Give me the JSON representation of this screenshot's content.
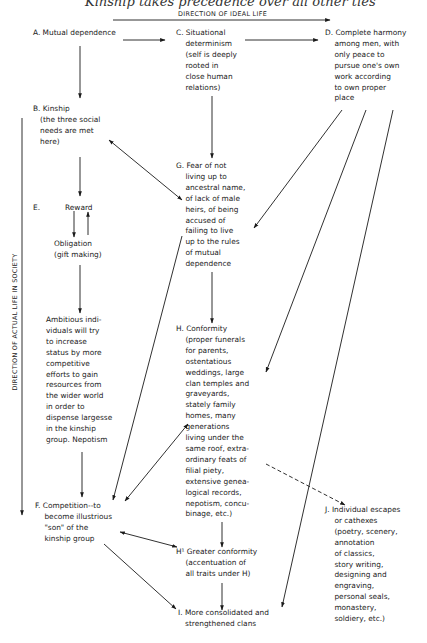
{
  "caption": "Kinship takes precedence over all other ties",
  "axes": {
    "horizontal": "DIRECTION OF IDEAL LIFE",
    "vertical": "DIRECTION OF ACTUAL LIFE IN SOCIETY"
  },
  "nodes": {
    "A": "A. Mutual dependence",
    "B": "B. Kinship\n   (the three social\n   needs are met\n   here)",
    "C": "C. Situational\n    determinism\n    (self is deeply\n    rooted in\n    close human\n    relations)",
    "D": "D. Complete harmony\n    among men, with\n    only peace to\n    pursue one's own\n    work according\n    to own proper\n    place",
    "E_label": "E.",
    "E_reward": "Reward",
    "E_obligation": "Obligation\n(gift making)",
    "E_ambition": "Ambitious indi-\nviduals will try\nto increase\nstatus by more\ncompetitive\nefforts to gain\nresources from\nthe wider world\nin order to\ndispense largesse\nin the kinship\ngroup. Nepotism",
    "F": "F. Competition--to\n    become illustrious\n    \"son\" of the\n    kinship group",
    "G": "G. Fear of not\n    living up to\n    ancestral name,\n    of lack of male\n    heirs, of being\n    accused of\n    failing to live\n    up to the rules\n    of mutual\n    dependence",
    "H": "H. Conformity\n    (proper funerals\n    for parents,\n    ostentatious\n    weddings, large\n    clan temples and\n    graveyards,\n    stately family\n    homes, many\n    generations\n    living under the\n    same roof, extra-\n    ordinary feats of\n    filial piety,\n    extensive genea-\n    logical records,\n    nepotism, concu-\n    binage, etc.)",
    "H1": "H¹ Greater conformity\n    (accentuation of\n    all traits under H)",
    "I": "I. More consolidated and\n   strengthened clans",
    "J": "J. Individual escapes\n    or cathexes\n    (poetry, scenery,\n    annotation\n    of classics,\n    story writing,\n    designing and\n    engraving,\n    personal seals,\n    monastery,\n    soldiery, etc.)"
  },
  "edges": [
    {
      "from": "A",
      "to": "C",
      "type": "arrow"
    },
    {
      "from": "C",
      "to": "D",
      "type": "arrow"
    },
    {
      "from": "A",
      "to": "B",
      "type": "arrow"
    },
    {
      "from": "C",
      "to": "G",
      "type": "arrow"
    },
    {
      "from": "B",
      "to": "G",
      "type": "double-arrow"
    },
    {
      "from": "D",
      "to": "G",
      "type": "arrow"
    },
    {
      "from": "D",
      "to": "H",
      "type": "arrow"
    },
    {
      "from": "D",
      "to": "I",
      "type": "arrow"
    },
    {
      "from": "B",
      "to": "Reward",
      "type": "arrow"
    },
    {
      "from": "Reward",
      "to": "Obligation",
      "type": "arrow"
    },
    {
      "from": "Obligation",
      "to": "Reward",
      "type": "arrow"
    },
    {
      "from": "Obligation",
      "to": "Ambition",
      "type": "arrow"
    },
    {
      "from": "Ambition",
      "to": "F",
      "type": "arrow"
    },
    {
      "from": "G",
      "to": "F",
      "type": "arrow"
    },
    {
      "from": "G",
      "to": "H",
      "type": "arrow"
    },
    {
      "from": "F",
      "to": "H",
      "type": "double-arrow"
    },
    {
      "from": "H",
      "to": "J",
      "type": "dashed-arrow"
    },
    {
      "from": "H",
      "to": "H1",
      "type": "arrow"
    },
    {
      "from": "F",
      "to": "H1",
      "type": "double-arrow"
    },
    {
      "from": "F",
      "to": "I",
      "type": "arrow"
    },
    {
      "from": "H1",
      "to": "I",
      "type": "arrow"
    }
  ]
}
